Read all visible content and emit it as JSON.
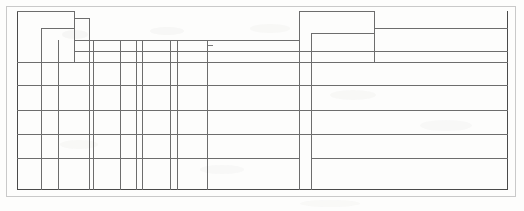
{
  "document": {
    "kind": "scanned-blank-table-form",
    "title": "",
    "page_width": 524,
    "page_height": 211,
    "background_color": "#fdfdfc",
    "ink_color": "#6d6d6d",
    "frame_color": "#c9c9c9"
  },
  "frame": {
    "outer": {
      "x": 6,
      "y": 6,
      "width": 510,
      "height": 191
    },
    "table": {
      "x": 17,
      "y": 11,
      "width": 491,
      "height": 179
    }
  },
  "table": {
    "caption": "",
    "column_headers": [],
    "row_headers": [],
    "rows": [
      {
        "cells": [
          "",
          "",
          "",
          "",
          "",
          "",
          "",
          "",
          "",
          "",
          "",
          "",
          ""
        ]
      },
      {
        "cells": [
          "",
          "",
          "",
          "",
          "",
          "",
          "",
          "",
          "",
          "",
          "",
          "",
          ""
        ]
      },
      {
        "cells": [
          "",
          "",
          "",
          "",
          "",
          "",
          "",
          "",
          "",
          "",
          "",
          "",
          ""
        ]
      },
      {
        "cells": [
          "",
          "",
          "",
          "",
          "",
          "",
          "",
          "",
          "",
          "",
          "",
          "",
          ""
        ]
      },
      {
        "cells": [
          "",
          "",
          "",
          "",
          "",
          "",
          "",
          "",
          "",
          "",
          "",
          "",
          ""
        ]
      },
      {
        "cells": [
          "",
          "",
          "",
          "",
          "",
          "",
          "",
          "",
          "",
          "",
          "",
          "",
          ""
        ]
      }
    ],
    "column_x": [
      0,
      17,
      41,
      70,
      76,
      103,
      119,
      125,
      153,
      160,
      190,
      282,
      295,
      357,
      423,
      491
    ],
    "row_y": [
      51,
      74,
      99,
      123,
      147,
      171,
      179
    ],
    "header_steps": [
      {
        "name": "header-block-a",
        "x": 17,
        "y": 0,
        "width": 58,
        "height": 51
      },
      {
        "name": "header-block-b",
        "x": 41,
        "y": 17,
        "width": 34,
        "height": 34
      },
      {
        "name": "header-block-c",
        "x": 75,
        "y": 7,
        "width": 15,
        "height": 44
      },
      {
        "name": "header-block-d",
        "x": 90,
        "y": 29,
        "width": 192,
        "height": 22
      },
      {
        "name": "header-block-e",
        "x": 282,
        "y": 0,
        "width": 75,
        "height": 51
      },
      {
        "name": "header-block-f",
        "x": 295,
        "y": 22,
        "width": 62,
        "height": 29
      },
      {
        "name": "header-block-g",
        "x": 357,
        "y": 17,
        "width": 134,
        "height": 34
      }
    ]
  },
  "artifacts": [
    {
      "name": "scan-tick-mark",
      "x": 191,
      "y": 34,
      "width": 5,
      "height": 2
    }
  ]
}
